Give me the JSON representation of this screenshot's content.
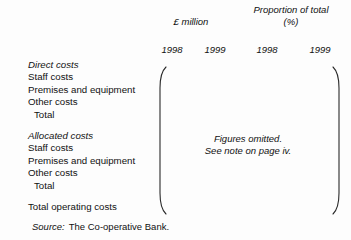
{
  "figure": {
    "column_groups": [
      {
        "id": "money",
        "label": "£ million"
      },
      {
        "id": "proportion",
        "label": "Proportion of total\n(%)"
      }
    ],
    "year_headers": [
      "1998",
      "1999",
      "1998",
      "1999"
    ],
    "row_blocks": [
      {
        "title": "Direct costs",
        "rows": [
          "Staff costs",
          "Premises and equipment",
          "Other costs"
        ],
        "total": "Total"
      },
      {
        "title": "Allocated costs",
        "rows": [
          "Staff costs",
          "Premises and equipment",
          "Other costs"
        ],
        "total": "Total"
      }
    ],
    "grand_total_row": "Total operating costs",
    "omitted_note": "Figures omitted.\nSee note on page iv.",
    "source": {
      "label": "Source:",
      "value": "The Co-operative Bank."
    },
    "colors": {
      "text": "#111111",
      "bracket": "#2a2a2a",
      "background": "#fdfdfd"
    }
  }
}
